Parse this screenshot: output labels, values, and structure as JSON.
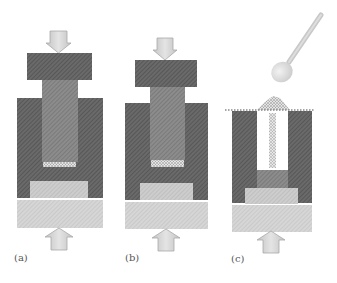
{
  "figure": {
    "panels": [
      {
        "id": "a",
        "label": "(a)",
        "label_pos": [
          14,
          252
        ],
        "top_arrow": {
          "x": 58.5,
          "y_top": 31,
          "y_tip": 53
        },
        "top_block": {
          "x": 27,
          "y": 53,
          "w": 65,
          "h": 27
        },
        "upper_punch": {
          "x": 42,
          "y": 80,
          "w": 36,
          "h": 84
        },
        "die": {
          "x": 17,
          "y": 98,
          "w": 86,
          "h": 100
        },
        "powder": {
          "x": 43,
          "y": 162,
          "w": 33,
          "h": 5
        },
        "lower_punch": {
          "x": 30,
          "y": 181,
          "w": 58,
          "h": 17
        },
        "base": {
          "x": 17,
          "y": 200,
          "w": 86,
          "h": 28
        },
        "bottom_arrow": {
          "x": 59,
          "y_tip": 228,
          "y_bottom": 250
        }
      },
      {
        "id": "b",
        "label": "(b)",
        "label_pos": [
          125,
          252
        ],
        "top_arrow": {
          "x": 165,
          "y_top": 38,
          "y_tip": 60
        },
        "top_block": {
          "x": 135,
          "y": 60,
          "w": 62,
          "h": 27
        },
        "upper_punch": {
          "x": 150,
          "y": 87,
          "w": 35,
          "h": 73
        },
        "die": {
          "x": 125,
          "y": 103,
          "w": 83,
          "h": 97
        },
        "powder": {
          "x": 151,
          "y": 160,
          "w": 33,
          "h": 7
        },
        "lower_punch": {
          "x": 140,
          "y": 183,
          "w": 53,
          "h": 17
        },
        "base": {
          "x": 125,
          "y": 202,
          "w": 83,
          "h": 27
        },
        "bottom_arrow": {
          "x": 166,
          "y_tip": 229,
          "y_bottom": 251
        }
      },
      {
        "id": "c",
        "label": "(c)",
        "label_pos": [
          231,
          253
        ],
        "fill_line": {
          "x1": 225,
          "x2": 315,
          "y": 110
        },
        "powder_mound": {
          "x1": 257,
          "x2": 290,
          "peak_y": 96,
          "base_y": 110
        },
        "die": {
          "x": 232,
          "y": 111,
          "w": 80,
          "h": 92
        },
        "cavity": {
          "x": 257,
          "y": 111,
          "w": 31,
          "h": 59
        },
        "punch_core": {
          "x": 257,
          "y": 170,
          "w": 31,
          "h": 18
        },
        "lower_punch": {
          "x": 245,
          "y": 188,
          "w": 53,
          "h": 16
        },
        "base": {
          "x": 232,
          "y": 205,
          "w": 80,
          "h": 27
        },
        "bottom_arrow": {
          "x": 271,
          "y_tip": 231,
          "y_bottom": 253
        },
        "spoon": {
          "bowl_cx": 282,
          "bowl_cy": 71,
          "bowl_r": 11,
          "handle_x1": 289,
          "handle_y1": 62,
          "handle_x2": 321,
          "handle_y2": 15
        }
      }
    ],
    "colors": {
      "die_dark": "#5f5f5f",
      "die_hatch": "#8a8a8a",
      "punch_mid": "#7c7c7c",
      "lower_punch": "#bdbdbd",
      "base": "#c9c9c9",
      "arrow_fill": "#d6d6d6",
      "arrow_stroke": "#a8a8a8",
      "powder": "#9a9a9a",
      "spoon": "#d9d9d9"
    }
  }
}
